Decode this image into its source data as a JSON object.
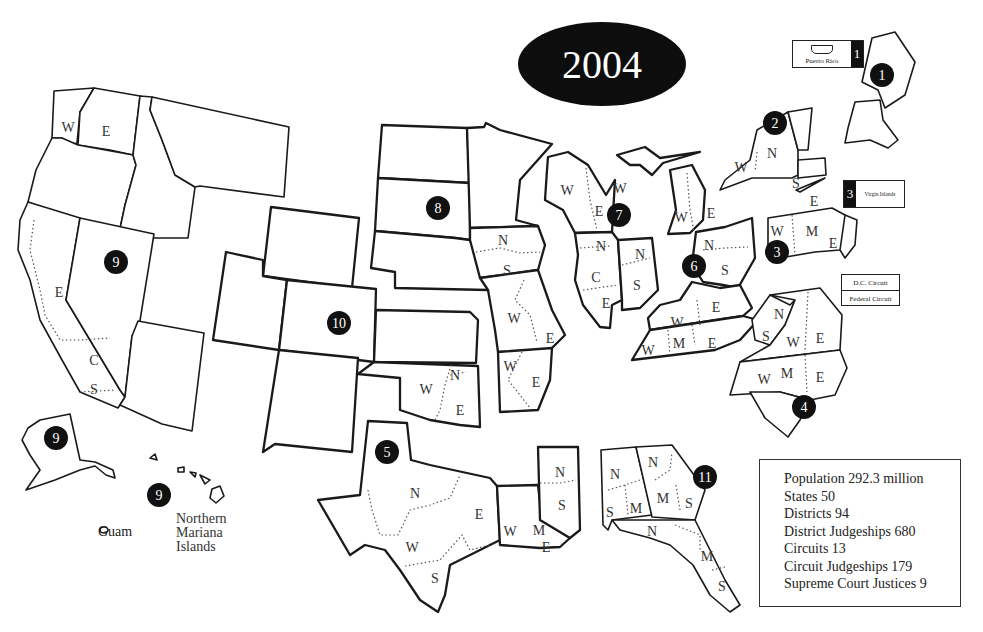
{
  "title": {
    "year": "2004"
  },
  "stats_box": {
    "items": [
      "Population 292.3 million",
      "States 50",
      "Districts 94",
      "District Judgeships 680",
      "Circuits 13",
      "Circuit Judgeships 179",
      "Supreme Court Justices 9"
    ]
  },
  "insets": {
    "puerto_rico": {
      "label": "Puerto Rico",
      "circuit": "1"
    },
    "virgin_islands": {
      "label": "Virgin Islands",
      "circuit": "3"
    },
    "dc_circuit": "D.C. Circuit",
    "federal_circuit": "Federal Circuit",
    "guam": "Guam",
    "northern_mariana_islands": "Northern Mariana Islands"
  },
  "circuits": [
    {
      "number": "1",
      "x": 882,
      "y": 75
    },
    {
      "number": "2",
      "x": 775,
      "y": 123
    },
    {
      "number": "3",
      "x": 777,
      "y": 252
    },
    {
      "number": "4",
      "x": 804,
      "y": 407
    },
    {
      "number": "5",
      "x": 387,
      "y": 452
    },
    {
      "number": "6",
      "x": 694,
      "y": 266
    },
    {
      "number": "7",
      "x": 619,
      "y": 215
    },
    {
      "number": "8",
      "x": 438,
      "y": 208
    },
    {
      "number": "9",
      "x": 116,
      "y": 262
    },
    {
      "number": "9",
      "x": 56,
      "y": 438
    },
    {
      "number": "9",
      "x": 159,
      "y": 495
    },
    {
      "number": "10",
      "x": 339,
      "y": 323
    },
    {
      "number": "11",
      "x": 705,
      "y": 477
    }
  ],
  "district_labels": [
    {
      "t": "W",
      "x": 68,
      "y": 127
    },
    {
      "t": "E",
      "x": 106,
      "y": 131
    },
    {
      "t": "E",
      "x": 59,
      "y": 292
    },
    {
      "t": "C",
      "x": 94,
      "y": 360
    },
    {
      "t": "S",
      "x": 94,
      "y": 389
    },
    {
      "t": "N",
      "x": 503,
      "y": 240
    },
    {
      "t": "S",
      "x": 507,
      "y": 270
    },
    {
      "t": "W",
      "x": 514,
      "y": 318
    },
    {
      "t": "E",
      "x": 550,
      "y": 338
    },
    {
      "t": "W",
      "x": 510,
      "y": 366
    },
    {
      "t": "E",
      "x": 536,
      "y": 382
    },
    {
      "t": "W",
      "x": 426,
      "y": 389
    },
    {
      "t": "N",
      "x": 455,
      "y": 375
    },
    {
      "t": "E",
      "x": 460,
      "y": 410
    },
    {
      "t": "W",
      "x": 567,
      "y": 190
    },
    {
      "t": "E",
      "x": 599,
      "y": 211
    },
    {
      "t": "N",
      "x": 601,
      "y": 246
    },
    {
      "t": "C",
      "x": 596,
      "y": 277
    },
    {
      "t": "E",
      "x": 606,
      "y": 303
    },
    {
      "t": "N",
      "x": 640,
      "y": 254
    },
    {
      "t": "S",
      "x": 637,
      "y": 285
    },
    {
      "t": "W",
      "x": 620,
      "y": 188
    },
    {
      "t": "W",
      "x": 681,
      "y": 217
    },
    {
      "t": "E",
      "x": 711,
      "y": 213
    },
    {
      "t": "N",
      "x": 709,
      "y": 245
    },
    {
      "t": "S",
      "x": 725,
      "y": 270
    },
    {
      "t": "W",
      "x": 677,
      "y": 322
    },
    {
      "t": "E",
      "x": 716,
      "y": 307
    },
    {
      "t": "W",
      "x": 648,
      "y": 350
    },
    {
      "t": "M",
      "x": 679,
      "y": 343
    },
    {
      "t": "E",
      "x": 712,
      "y": 343
    },
    {
      "t": "W",
      "x": 741,
      "y": 167
    },
    {
      "t": "N",
      "x": 772,
      "y": 153
    },
    {
      "t": "S",
      "x": 796,
      "y": 183
    },
    {
      "t": "E",
      "x": 814,
      "y": 201
    },
    {
      "t": "W",
      "x": 777,
      "y": 231
    },
    {
      "t": "M",
      "x": 812,
      "y": 231
    },
    {
      "t": "E",
      "x": 833,
      "y": 243
    },
    {
      "t": "N",
      "x": 779,
      "y": 314
    },
    {
      "t": "S",
      "x": 766,
      "y": 336
    },
    {
      "t": "W",
      "x": 793,
      "y": 342
    },
    {
      "t": "E",
      "x": 820,
      "y": 338
    },
    {
      "t": "W",
      "x": 764,
      "y": 379
    },
    {
      "t": "M",
      "x": 787,
      "y": 373
    },
    {
      "t": "E",
      "x": 820,
      "y": 377
    },
    {
      "t": "N",
      "x": 415,
      "y": 493
    },
    {
      "t": "E",
      "x": 479,
      "y": 514
    },
    {
      "t": "W",
      "x": 412,
      "y": 547
    },
    {
      "t": "S",
      "x": 435,
      "y": 578
    },
    {
      "t": "W",
      "x": 510,
      "y": 531
    },
    {
      "t": "N",
      "x": 560,
      "y": 472
    },
    {
      "t": "S",
      "x": 562,
      "y": 505
    },
    {
      "t": "M",
      "x": 539,
      "y": 530
    },
    {
      "t": "E",
      "x": 546,
      "y": 547
    },
    {
      "t": "N",
      "x": 615,
      "y": 474
    },
    {
      "t": "S",
      "x": 610,
      "y": 512
    },
    {
      "t": "M",
      "x": 636,
      "y": 508
    },
    {
      "t": "N",
      "x": 653,
      "y": 462
    },
    {
      "t": "M",
      "x": 663,
      "y": 498
    },
    {
      "t": "S",
      "x": 689,
      "y": 503
    },
    {
      "t": "N",
      "x": 652,
      "y": 531
    },
    {
      "t": "M",
      "x": 707,
      "y": 556
    },
    {
      "t": "S",
      "x": 722,
      "y": 586
    }
  ]
}
